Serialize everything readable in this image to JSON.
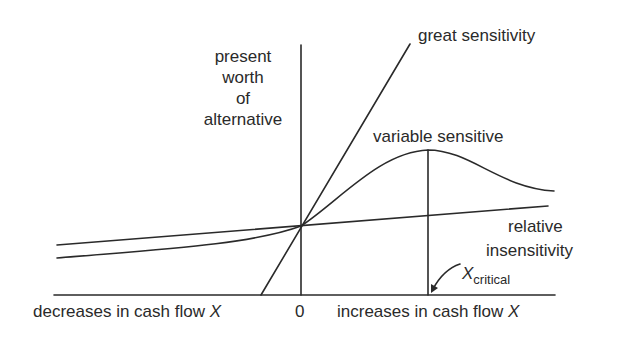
{
  "diagram": {
    "y_axis_label": [
      "present",
      "worth",
      "of",
      "alternative"
    ],
    "x_axis_left_label": "decreases in cash flow ",
    "x_axis_right_label": "increases in cash flow ",
    "x_var": "X",
    "origin_label": "0",
    "curves": {
      "great": "great sensitivity",
      "variable": "variable sensitive",
      "relative_line1": "relative",
      "relative_line2": "insensitivity"
    },
    "critical": {
      "symbol": "X",
      "subscript": "critical"
    },
    "colors": {
      "ink": "#2a2a2a",
      "background": "#ffffff"
    }
  }
}
